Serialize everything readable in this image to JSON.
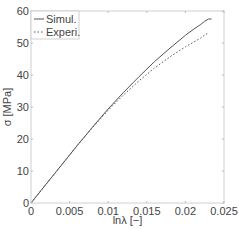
{
  "chart_data": {
    "type": "line",
    "title": "",
    "xlabel": "lnλ [−]",
    "ylabel": "σ [MPa]",
    "xlim": [
      0,
      0.025
    ],
    "ylim": [
      0,
      60
    ],
    "xticks": [
      0,
      0.005,
      0.01,
      0.015,
      0.02,
      0.025
    ],
    "xtick_labels": [
      "0",
      "0.005",
      "0.01",
      "0.015",
      "0.02",
      "0.025"
    ],
    "yticks": [
      0,
      10,
      20,
      30,
      40,
      50,
      60
    ],
    "ytick_labels": [
      "0",
      "10",
      "20",
      "30",
      "40",
      "50",
      "60"
    ],
    "grid": false,
    "legend_position": "upper left",
    "series": [
      {
        "name": "Simul.",
        "style": "solid",
        "color": "#555555",
        "x": [
          0,
          0.002,
          0.004,
          0.006,
          0.008,
          0.01,
          0.012,
          0.014,
          0.016,
          0.018,
          0.02,
          0.021,
          0.022,
          0.0225,
          0.023,
          0.0234
        ],
        "y": [
          0,
          6.0,
          12.0,
          18.0,
          23.8,
          29.4,
          34.6,
          39.5,
          44.2,
          48.4,
          52.4,
          54.2,
          55.8,
          56.8,
          57.5,
          57.5
        ]
      },
      {
        "name": "Experi.",
        "style": "dotted",
        "color": "#555555",
        "x": [
          0,
          0.002,
          0.004,
          0.006,
          0.008,
          0.01,
          0.012,
          0.014,
          0.016,
          0.018,
          0.02,
          0.021,
          0.022,
          0.0225,
          0.023
        ],
        "y": [
          0,
          6.0,
          12.0,
          18.0,
          23.7,
          29.0,
          33.8,
          38.2,
          42.2,
          45.7,
          48.8,
          50.2,
          51.6,
          52.5,
          53.2
        ]
      }
    ]
  }
}
